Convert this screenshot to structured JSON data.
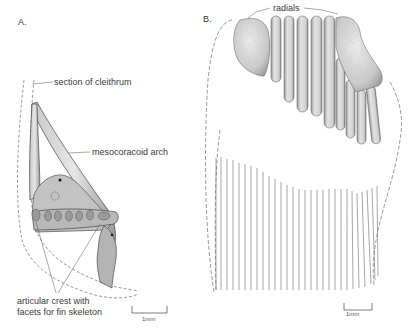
{
  "figure": {
    "panels": [
      {
        "id": "A",
        "letter": "A.",
        "labels": {
          "cleithrum": "section of cleithrum",
          "arch": "mesocoracoid arch",
          "crest_line1": "articular crest with",
          "crest_line2": "facets for fin skeleton"
        },
        "scale_bar": "1mm"
      },
      {
        "id": "B",
        "letter": "B.",
        "labels": {
          "radials": "radials"
        },
        "scale_bar": "1mm",
        "fin_ray_count": 29,
        "radial_count": 11
      }
    ],
    "colors": {
      "ink": "#3a3a3a",
      "stipple": "#8a8a8a",
      "bone_light": "#d8d8d8",
      "bone_mid": "#b5b5b5",
      "ray": "#6a6a6a"
    }
  }
}
